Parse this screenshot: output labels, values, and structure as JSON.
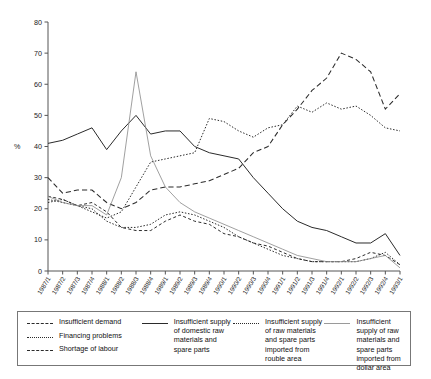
{
  "chart_data": {
    "type": "line",
    "title": "",
    "xlabel": "",
    "ylabel": "%",
    "ylim": [
      0,
      80
    ],
    "yticks": [
      0,
      10,
      20,
      30,
      40,
      50,
      60,
      70,
      80
    ],
    "grid": false,
    "legend_position": "bottom",
    "categories": [
      "1987/1",
      "1987/2",
      "1987/3",
      "1987/4",
      "1988/1",
      "1988/2",
      "1988/3",
      "1988/4",
      "1989/1",
      "1989/2",
      "1989/3",
      "1989/4",
      "1990/1",
      "1990/2",
      "1990/3",
      "1990/4",
      "1991/1",
      "1991/2",
      "1991/3",
      "1991/4",
      "1992/1",
      "1992/2",
      "1992/3",
      "1992/4",
      "1993/1"
    ],
    "series": [
      {
        "name": "Insufficient demand",
        "style": "long-dash",
        "values": [
          30,
          25,
          26,
          26,
          22,
          20,
          22,
          26,
          27,
          27,
          28,
          29,
          31,
          33,
          38,
          40,
          47,
          52,
          58,
          62,
          70,
          68,
          64,
          52,
          57
        ]
      },
      {
        "name": "Financing problems",
        "style": "dotted",
        "values": [
          22,
          23,
          21,
          19,
          17,
          19,
          27,
          35,
          36,
          37,
          38,
          49,
          48,
          45,
          43,
          46,
          47,
          53,
          51,
          54,
          52,
          53,
          50,
          46,
          45
        ]
      },
      {
        "name": "Shortage of labour",
        "style": "medium-dash",
        "values": [
          24,
          23,
          21,
          22,
          19,
          14,
          13,
          13,
          16,
          18,
          16,
          15,
          12,
          11,
          9,
          8,
          6,
          4,
          3,
          3,
          3,
          4,
          6,
          5,
          2
        ]
      },
      {
        "name": "Insufficient supply of domestic raw materials and spare parts",
        "style": "solid",
        "values": [
          41,
          42,
          44,
          46,
          39,
          45,
          50,
          44,
          45,
          45,
          40,
          38,
          37,
          36,
          30,
          25,
          20,
          16,
          14,
          13,
          11,
          9,
          9,
          12,
          5
        ]
      },
      {
        "name": "Insufficient supply of raw materials and spare parts imported from rouble area",
        "style": "dotted",
        "values": [
          23,
          22,
          21,
          20,
          16,
          14,
          14,
          15,
          18,
          19,
          18,
          16,
          14,
          11,
          9,
          7,
          5,
          4,
          3,
          3,
          3,
          3,
          4,
          6,
          2
        ]
      },
      {
        "name": "Insufficient supply of raw materials and spare parts imported from dollar area",
        "style": "thin-solid",
        "values": [
          24,
          22,
          21,
          21,
          18,
          30,
          64,
          37,
          27,
          22,
          19,
          17,
          15,
          13,
          11,
          9,
          7,
          5,
          4,
          3,
          3,
          3,
          4,
          5,
          1
        ]
      }
    ]
  },
  "legend": {
    "columns": [
      {
        "entries": [
          {
            "label": "Insufficient demand",
            "sample": "long-dash-sample"
          },
          {
            "label": "Financing problems",
            "sample": "dotted-sample"
          },
          {
            "label": "Shortage of labour",
            "sample": "medium-dash-sample"
          }
        ]
      },
      {
        "entries": [
          {
            "label": "Insufficient supply of domestic raw materials and spare parts",
            "sample": "solid-sample"
          }
        ]
      },
      {
        "entries": [
          {
            "label": "Insufficient supply of raw materials and spare parts imported from rouble area",
            "sample": "dotted-sample"
          }
        ]
      },
      {
        "entries": [
          {
            "label": "Insufficient supply of raw materials and spare parts imported from dollar area",
            "sample": "thin-solid-sample"
          }
        ]
      }
    ]
  }
}
